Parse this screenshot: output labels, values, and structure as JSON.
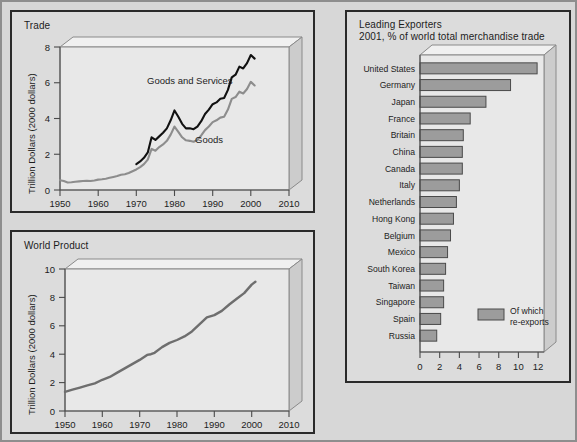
{
  "figure": {
    "background_color": "#d7d7d7",
    "panel_color": "#dcdcdc",
    "bar_color": "#9c9c9c",
    "line_black_color": "#111111",
    "line_gray_color": "#8d8d8d"
  },
  "panels": {
    "trade": {
      "title": "Trade",
      "ylabel": "Trillion Dollars (2000 dollars)",
      "annotation_goods_services": "Goods and Services",
      "annotation_goods": "Goods"
    },
    "world_product": {
      "title": "World Product",
      "ylabel": "Trillion Dollars (2000 dollars)"
    },
    "exporters": {
      "title_line1": "Leading Exporters",
      "title_line2": "2001, % of world total merchandise trade",
      "legend_line1": "Of which",
      "legend_line2": "re-exports"
    }
  },
  "chart_data": [
    {
      "id": "trade",
      "type": "line",
      "title": "Trade",
      "xlabel": "",
      "ylabel": "Trillion Dollars (2000 dollars)",
      "xlim": [
        1950,
        2010
      ],
      "ylim": [
        0,
        8
      ],
      "xticks": [
        1950,
        1960,
        1970,
        1980,
        1990,
        2000,
        2010
      ],
      "yticks": [
        0,
        2,
        4,
        6,
        8
      ],
      "grid": false,
      "legend_position": "inline-annotations",
      "series": [
        {
          "name": "Goods and Services",
          "color": "#111111",
          "x": [
            1970,
            1971,
            1972,
            1973,
            1974,
            1975,
            1976,
            1977,
            1978,
            1979,
            1980,
            1981,
            1982,
            1983,
            1984,
            1985,
            1986,
            1987,
            1988,
            1989,
            1990,
            1991,
            1992,
            1993,
            1994,
            1995,
            1996,
            1997,
            1998,
            1999,
            2000,
            2001
          ],
          "values": [
            1.45,
            1.6,
            1.8,
            2.1,
            2.95,
            2.8,
            3.0,
            3.2,
            3.45,
            3.9,
            4.45,
            4.1,
            3.7,
            3.45,
            3.45,
            3.4,
            3.55,
            3.85,
            4.25,
            4.5,
            4.8,
            4.9,
            5.1,
            5.15,
            5.6,
            6.3,
            6.45,
            6.9,
            6.8,
            7.1,
            7.55,
            7.35
          ]
        },
        {
          "name": "Goods",
          "color": "#8d8d8d",
          "x": [
            1950,
            1951,
            1952,
            1953,
            1954,
            1955,
            1956,
            1957,
            1958,
            1959,
            1960,
            1961,
            1962,
            1963,
            1964,
            1965,
            1966,
            1967,
            1968,
            1969,
            1970,
            1971,
            1972,
            1973,
            1974,
            1975,
            1976,
            1977,
            1978,
            1979,
            1980,
            1981,
            1982,
            1983,
            1984,
            1985,
            1986,
            1987,
            1988,
            1989,
            1990,
            1991,
            1992,
            1993,
            1994,
            1995,
            1996,
            1997,
            1998,
            1999,
            2000,
            2001
          ],
          "values": [
            0.55,
            0.5,
            0.42,
            0.43,
            0.46,
            0.48,
            0.5,
            0.52,
            0.5,
            0.53,
            0.58,
            0.6,
            0.63,
            0.68,
            0.73,
            0.78,
            0.85,
            0.88,
            0.95,
            1.05,
            1.15,
            1.28,
            1.45,
            1.7,
            2.3,
            2.2,
            2.4,
            2.55,
            2.75,
            3.1,
            3.55,
            3.25,
            2.95,
            2.78,
            2.75,
            2.7,
            2.8,
            3.05,
            3.35,
            3.55,
            3.8,
            3.9,
            4.05,
            4.1,
            4.5,
            5.1,
            5.2,
            5.5,
            5.4,
            5.65,
            6.05,
            5.85
          ]
        }
      ]
    },
    {
      "id": "world_product",
      "type": "line",
      "title": "World Product",
      "xlabel": "",
      "ylabel": "Trillion Dollars (2000 dollars)",
      "xlim": [
        1950,
        2010
      ],
      "ylim": [
        0,
        10
      ],
      "xticks": [
        1950,
        1960,
        1970,
        1980,
        1990,
        2000,
        2010
      ],
      "yticks": [
        0,
        2,
        4,
        6,
        8,
        10
      ],
      "grid": false,
      "series": [
        {
          "name": "World Product",
          "color": "#6e6e6e",
          "x": [
            1950,
            1952,
            1954,
            1956,
            1958,
            1960,
            1962,
            1964,
            1966,
            1968,
            1970,
            1972,
            1973,
            1974,
            1976,
            1978,
            1980,
            1982,
            1984,
            1986,
            1988,
            1990,
            1992,
            1994,
            1996,
            1998,
            2000,
            2001
          ],
          "values": [
            1.35,
            1.5,
            1.65,
            1.8,
            1.95,
            2.2,
            2.4,
            2.7,
            3.0,
            3.3,
            3.6,
            3.95,
            4.0,
            4.1,
            4.5,
            4.8,
            5.0,
            5.25,
            5.6,
            6.1,
            6.6,
            6.75,
            7.05,
            7.5,
            7.9,
            8.3,
            8.9,
            9.1
          ]
        }
      ]
    },
    {
      "id": "leading_exporters",
      "type": "bar",
      "orientation": "horizontal",
      "title": "Leading Exporters",
      "subtitle": "2001, % of world total merchandise trade",
      "xlabel": "",
      "ylabel": "",
      "xlim": [
        0,
        12.6
      ],
      "xticks": [
        0,
        2,
        4,
        6,
        8,
        10,
        12
      ],
      "grid": false,
      "legend": [
        "Of which re-exports"
      ],
      "categories": [
        "United States",
        "Germany",
        "Japan",
        "France",
        "Britain",
        "China",
        "Canada",
        "Italy",
        "Netherlands",
        "Hong Kong",
        "Belgium",
        "Mexico",
        "South Korea",
        "Taiwan",
        "Singapore",
        "Spain",
        "Russia"
      ],
      "values": [
        11.9,
        9.2,
        6.7,
        5.1,
        4.4,
        4.3,
        4.3,
        4.0,
        3.7,
        3.4,
        3.1,
        2.8,
        2.6,
        2.4,
        2.4,
        2.1,
        1.7
      ]
    }
  ]
}
